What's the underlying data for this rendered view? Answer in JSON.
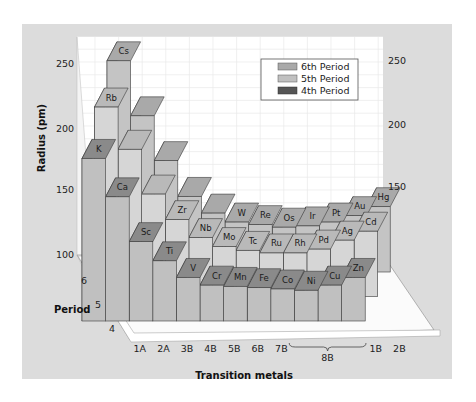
{
  "colors": {
    "page_bg": "#ffffff",
    "frame_bg": "#dcdcdc",
    "wall_bg": "#ffffff",
    "grid": "#e9e9e9",
    "floor": "#fbfbfb",
    "period6": {
      "top": "#a9a9a9",
      "front": "#c4c4c4",
      "side": "#8f8f8f"
    },
    "period5": {
      "top": "#b9b9b9",
      "front": "#d6d6d6",
      "side": "#a3a3a3"
    },
    "period4": {
      "top": "#8a8a8a",
      "front": "#c0c0c0",
      "side": "#4a4a4a"
    },
    "edge": "#3a3a3a"
  },
  "chart_data": {
    "type": "bar",
    "subtype": "3d-grouped-bar",
    "title": "",
    "xlabel": "Transition metals",
    "ylabel": "Radius (pm)",
    "zlabel": "Period",
    "ylim": [
      100,
      270
    ],
    "yticks": [
      100,
      150,
      200,
      250
    ],
    "right_yticks": [
      150,
      200,
      250
    ],
    "categories": [
      "1A",
      "2A",
      "3B",
      "4B",
      "5B",
      "6B",
      "7B",
      "8B",
      "8B",
      "8B",
      "1B",
      "2B"
    ],
    "category_group_label": "8B",
    "periods": [
      "4",
      "5",
      "6"
    ],
    "grid": true,
    "legend_position": "upper-right",
    "series": [
      {
        "name": "6th Period",
        "period": 6,
        "elements": [
          "Cs",
          "Ba",
          "La",
          "Hf",
          "Ta",
          "W",
          "Re",
          "Os",
          "Ir",
          "Pt",
          "Au",
          "Hg"
        ],
        "labels_shown": [
          "Cs",
          "",
          "",
          "",
          "",
          "W",
          "Re",
          "Os",
          "Ir",
          "Pt",
          "Au",
          "Hg"
        ],
        "values": [
          265,
          222,
          187,
          159,
          146,
          139,
          137,
          135,
          136,
          139,
          144,
          151
        ]
      },
      {
        "name": "5th Period",
        "period": 5,
        "elements": [
          "Rb",
          "Sr",
          "Y",
          "Zr",
          "Nb",
          "Mo",
          "Tc",
          "Ru",
          "Rh",
          "Pd",
          "Ag",
          "Cd"
        ],
        "labels_shown": [
          "Rb",
          "",
          "",
          "Zr",
          "Nb",
          "Mo",
          "Tc",
          "Ru",
          "Rh",
          "Pd",
          "Ag",
          "Cd"
        ],
        "values": [
          248,
          215,
          180,
          160,
          146,
          139,
          136,
          134,
          134,
          137,
          144,
          151
        ]
      },
      {
        "name": "4th Period",
        "period": 4,
        "elements": [
          "K",
          "Ca",
          "Sc",
          "Ti",
          "V",
          "Cr",
          "Mn",
          "Fe",
          "Co",
          "Ni",
          "Cu",
          "Zn"
        ],
        "labels_shown": [
          "K",
          "Ca",
          "Sc",
          "Ti",
          "V",
          "Cr",
          "Mn",
          "Fe",
          "Co",
          "Ni",
          "Cu",
          "Zn"
        ],
        "values": [
          227,
          197,
          162,
          147,
          134,
          128,
          127,
          126,
          125,
          124,
          128,
          134
        ]
      }
    ]
  },
  "legend": {
    "items": [
      {
        "label": "6th Period",
        "key": "period6"
      },
      {
        "label": "5th Period",
        "key": "period5"
      },
      {
        "label": "4th Period",
        "key": "period4"
      }
    ]
  },
  "axes": {
    "y_title": "Radius (pm)",
    "x_title": "Transition metals",
    "z_title": "Period",
    "left_ticks": [
      "250",
      "200",
      "150",
      "100"
    ],
    "right_ticks": [
      "250",
      "200",
      "150"
    ],
    "period_ticks": [
      "6",
      "5",
      "4"
    ],
    "x_ticks": [
      "1A",
      "2A",
      "3B",
      "4B",
      "5B",
      "6B",
      "7B",
      "1B",
      "2B"
    ],
    "x_group_label": "8B"
  }
}
